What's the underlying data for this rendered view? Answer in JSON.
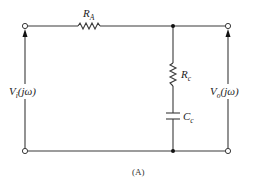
{
  "diagram": {
    "type": "circuit-schematic",
    "caption": "(A)",
    "components": {
      "resistor_a": {
        "symbol": "R",
        "subscript": "A"
      },
      "resistor_c": {
        "symbol": "R",
        "subscript": "c"
      },
      "capacitor_c": {
        "symbol": "C",
        "subscript": "c"
      }
    },
    "input_voltage": {
      "symbol": "V",
      "subscript": "i",
      "arg": "(jω)"
    },
    "output_voltage": {
      "symbol": "V",
      "subscript": "o",
      "arg": "(jω)"
    },
    "colors": {
      "line": "#3a3a3a",
      "node": "#111111",
      "background": "#ffffff"
    }
  }
}
